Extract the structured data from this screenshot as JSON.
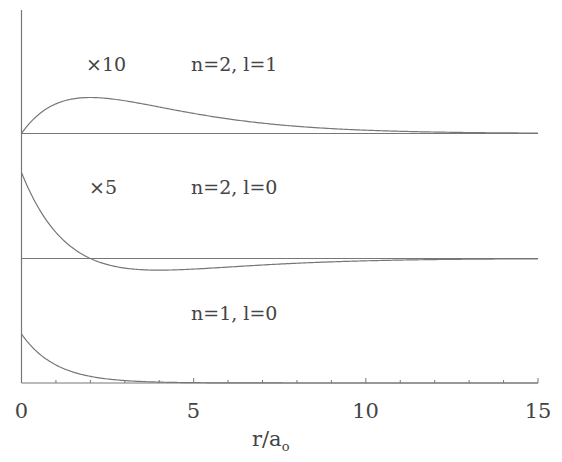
{
  "chart_data": {
    "type": "line",
    "title": "",
    "xlabel": "r/a_o",
    "xlabel_main": "r/a",
    "xlabel_sub": "o",
    "ylabel": "",
    "xlim": [
      0,
      15
    ],
    "x_ticks": [
      "0",
      "5",
      "10",
      "15"
    ],
    "minor_tick_step": 1,
    "grid": false,
    "legend": null,
    "panels": [
      {
        "name": "n=2, l=1",
        "label": "n=2, l=1",
        "scale_label": "×10",
        "function": "10 × R21(r)  ∝ r·exp(-r/2)",
        "x": [
          0,
          0.5,
          1,
          1.5,
          2,
          3,
          4,
          5,
          6,
          8,
          10,
          12,
          15
        ],
        "values": [
          0,
          0.52,
          0.82,
          0.96,
          1.0,
          0.92,
          0.74,
          0.56,
          0.41,
          0.2,
          0.09,
          0.04,
          0.01
        ]
      },
      {
        "name": "n=2, l=0",
        "label": "n=2, l=0",
        "scale_label": "×5",
        "function": "5 × R20(r)  ∝ (2-r)·exp(-r/2)",
        "x": [
          0,
          0.5,
          1,
          1.5,
          2,
          3,
          4,
          5,
          6,
          8,
          10,
          12,
          15
        ],
        "values": [
          1.0,
          0.58,
          0.3,
          0.12,
          0,
          -0.11,
          -0.135,
          -0.123,
          -0.1,
          -0.055,
          -0.027,
          -0.012,
          -0.003
        ]
      },
      {
        "name": "n=1, l=0",
        "label": "n=1, l=0",
        "scale_label": "",
        "function": "R10(r) ∝ exp(-r)",
        "x": [
          0,
          0.5,
          1,
          1.5,
          2,
          3,
          4,
          5,
          6,
          8,
          10,
          15
        ],
        "values": [
          1.0,
          0.61,
          0.37,
          0.22,
          0.14,
          0.05,
          0.018,
          0.007,
          0.002,
          0,
          0,
          0
        ]
      }
    ]
  },
  "labels": {
    "top_scale": "×10",
    "top_state": "n=2, l=1",
    "mid_scale": "×5",
    "mid_state": "n=2, l=0",
    "bot_state": "n=1, l=0",
    "tick0": "0",
    "tick5": "5",
    "tick10": "10",
    "tick15": "15",
    "xlabel_main": "r/a",
    "xlabel_sub": "o"
  }
}
